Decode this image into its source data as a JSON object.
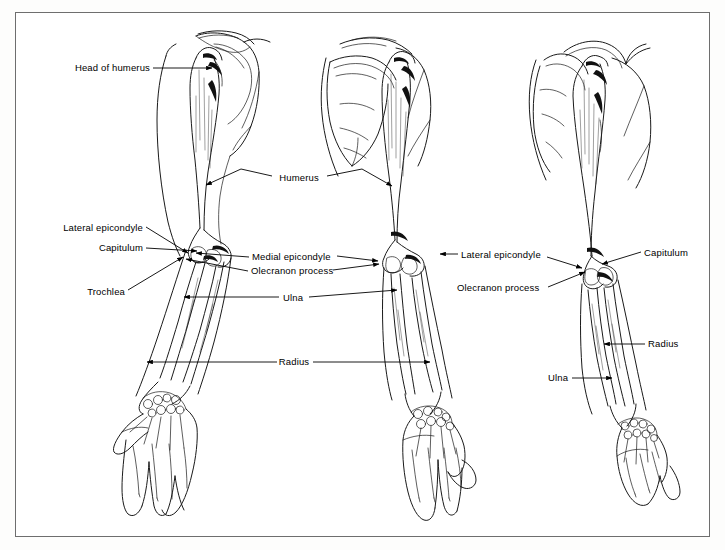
{
  "figure": {
    "domain_type": "anatomical-illustration",
    "background_color": "#fdfdfc",
    "plate_background": "#ffffff",
    "frame_color": "#6e6e6e",
    "ink_color": "#000000",
    "views": [
      {
        "id": "left-view",
        "name": "anterior view of right upper limb"
      },
      {
        "id": "center-view",
        "name": "posterior view of right upper limb"
      },
      {
        "id": "right-view",
        "name": "lateral view of right upper limb"
      }
    ]
  },
  "labels": {
    "left": [
      {
        "id": "head-of-humerus",
        "text": "Head of humerus",
        "x": 150,
        "y": 68,
        "align": "r"
      },
      {
        "id": "lateral-epicondyle-left",
        "text": "Lateral epicondyle",
        "x": 143,
        "y": 228,
        "align": "r"
      },
      {
        "id": "capitulum-left",
        "text": "Capitulum",
        "x": 143,
        "y": 248,
        "align": "r"
      },
      {
        "id": "trochlea-left",
        "text": "Trochlea",
        "x": 125,
        "y": 292,
        "align": "r"
      }
    ],
    "center": [
      {
        "id": "humerus-center",
        "text": "Humerus",
        "x": 299,
        "y": 178,
        "align": "c"
      },
      {
        "id": "medial-epicondyle-center",
        "text": "Medial epicondyle",
        "x": 252,
        "y": 257,
        "align": "l"
      },
      {
        "id": "olecranon-process-center",
        "text": "Olecranon process",
        "x": 251,
        "y": 271,
        "align": "l"
      },
      {
        "id": "ulna-center",
        "text": "Ulna",
        "x": 293,
        "y": 298,
        "align": "c"
      },
      {
        "id": "radius-center",
        "text": "Radius",
        "x": 294,
        "y": 362,
        "align": "c"
      }
    ],
    "right": [
      {
        "id": "lateral-epicondyle-right",
        "text": "Lateral epicondyle",
        "x": 461,
        "y": 255,
        "align": "l"
      },
      {
        "id": "capitulum-right",
        "text": "Capitulum",
        "x": 644,
        "y": 253,
        "align": "l"
      },
      {
        "id": "olecranon-process-right",
        "text": "Olecranon process",
        "x": 457,
        "y": 288,
        "align": "l"
      },
      {
        "id": "radius-right",
        "text": "Radius",
        "x": 648,
        "y": 344,
        "align": "l"
      },
      {
        "id": "ulna-right",
        "text": "Ulna",
        "x": 548,
        "y": 378,
        "align": "l"
      }
    ]
  },
  "leaders": [
    {
      "id": "leader-head-of-humerus",
      "d": "M 153 68 L 212 68"
    },
    {
      "id": "leader-lateral-epicondyle-left",
      "d": "M 146 227 L 188 253"
    },
    {
      "id": "leader-capitulum-left",
      "d": "M 146 248 L 197 251"
    },
    {
      "id": "leader-trochlea-left",
      "d": "M 128 290 L 183 257"
    },
    {
      "id": "leader-humerus-left-arm",
      "d": "M 272 176 L 241 169 L 206 185"
    },
    {
      "id": "leader-humerus-right-arm",
      "d": "M 327 176 L 362 169 L 392 186"
    },
    {
      "id": "leader-medial-epicondyle-center",
      "d": "M 249 257 L 196 253"
    },
    {
      "id": "leader-medial-epicondyle-center-r",
      "d": "M 337 256 L 378 261"
    },
    {
      "id": "leader-olecranon-center",
      "d": "M 248 271 L 186 259"
    },
    {
      "id": "leader-olecranon-center-r",
      "d": "M 333 270 L 379 264"
    },
    {
      "id": "leader-ulna-center-l",
      "d": "M 279 297 L 184 297"
    },
    {
      "id": "leader-ulna-center-r",
      "d": "M 309 297 L 397 290"
    },
    {
      "id": "leader-radius-center-l",
      "d": "M 277 362 L 147 362"
    },
    {
      "id": "leader-radius-center-r",
      "d": "M 313 362 L 430 362"
    },
    {
      "id": "leader-lateral-epicondyle-right-l",
      "d": "M 458 254 L 440 254"
    },
    {
      "id": "leader-lateral-epicondyle-right-r",
      "d": "M 547 257 L 582 268"
    },
    {
      "id": "leader-capitulum-right",
      "d": "M 641 252 L 602 264"
    },
    {
      "id": "leader-olecranon-right",
      "d": "M 548 287 L 585 272"
    },
    {
      "id": "leader-radius-right",
      "d": "M 645 344 L 604 344"
    },
    {
      "id": "leader-ulna-right",
      "d": "M 572 378 L 612 378"
    }
  ]
}
